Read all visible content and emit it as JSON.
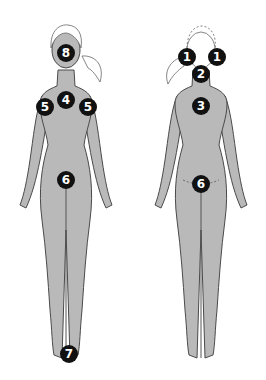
{
  "colors": {
    "body": "#b9b9b9",
    "outline": "#4a4a4a",
    "hair": "#ffffff",
    "marker": "#111111",
    "marker_text": "#ffffff"
  },
  "figures": {
    "front": {
      "markers": [
        {
          "label": "8",
          "x": 66,
          "y": 53
        },
        {
          "label": "4",
          "x": 66,
          "y": 100
        },
        {
          "label": "5",
          "x": 45,
          "y": 107
        },
        {
          "label": "5",
          "x": 88,
          "y": 107
        },
        {
          "label": "6",
          "x": 66,
          "y": 180
        },
        {
          "label": "7",
          "x": 69,
          "y": 354
        }
      ]
    },
    "back": {
      "markers": [
        {
          "label": "1",
          "x": 187,
          "y": 57
        },
        {
          "label": "1",
          "x": 217,
          "y": 57
        },
        {
          "label": "2",
          "x": 201,
          "y": 74
        },
        {
          "label": "3",
          "x": 201,
          "y": 106
        },
        {
          "label": "6",
          "x": 201,
          "y": 184
        }
      ]
    }
  }
}
